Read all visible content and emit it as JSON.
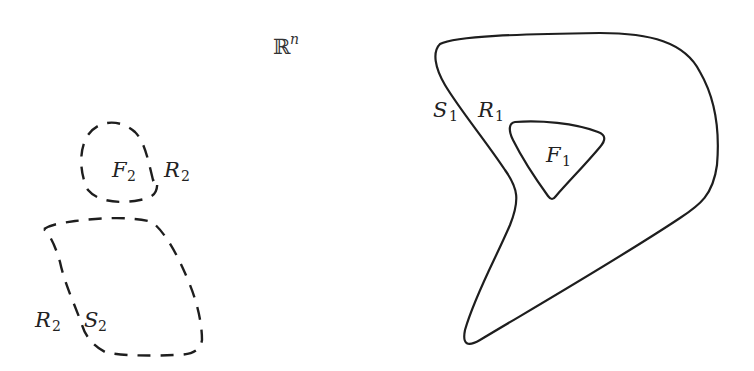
{
  "diagram": {
    "space_label": {
      "symbol": "ℝ",
      "superscript": "n"
    },
    "region_1": {
      "style": "solid",
      "outer_boundary_label": {
        "main": "S",
        "sub": "1"
      },
      "region_label": {
        "main": "R",
        "sub": "1"
      },
      "inner_set_label": {
        "main": "F",
        "sub": "1"
      }
    },
    "region_2": {
      "style": "dashed",
      "small_component": {
        "inner_set_label": {
          "main": "F",
          "sub": "2"
        },
        "region_label": {
          "main": "R",
          "sub": "2"
        }
      },
      "large_component": {
        "region_label": {
          "main": "R",
          "sub": "2"
        },
        "boundary_label": {
          "main": "S",
          "sub": "2"
        }
      }
    },
    "colors": {
      "stroke": "#1e1e1e",
      "text": "#222222",
      "background": "#ffffff"
    }
  }
}
